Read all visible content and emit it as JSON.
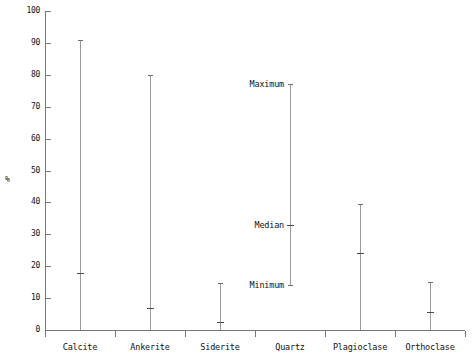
{
  "figure": {
    "width": 473,
    "height": 360,
    "background": "#ffffff"
  },
  "axes": {
    "y_title": "%",
    "y_ticks": [
      "0",
      "10",
      "20",
      "30",
      "40",
      "50",
      "60",
      "70",
      "80",
      "90",
      "100"
    ],
    "x_labels": [
      "Calcite",
      "Ankerite",
      "Siderite",
      "Quartz",
      "Plagioclase",
      "Orthoclase"
    ]
  },
  "annotations": [
    {
      "label": "Maximum",
      "value": 77
    },
    {
      "label": "Median",
      "value": 33
    },
    {
      "label": "Minimum",
      "value": 14
    }
  ],
  "colors": {
    "axis": "#777777",
    "range_line": "#9a9a9a",
    "cap": "#6f6f6f",
    "median": "#4a4a4a",
    "text": "#111111"
  },
  "chart_data": {
    "type": "bar",
    "title": "",
    "subtitle": "",
    "xlabel": "",
    "ylabel": "%",
    "ylim": [
      0,
      100
    ],
    "ytick_values": [
      0,
      10,
      20,
      30,
      40,
      50,
      60,
      70,
      80,
      90,
      100
    ],
    "grid": false,
    "legend": "none",
    "note": "Range (min-max) plot with median tick marks for mineral abundance in percent.",
    "categories": [
      "Calcite",
      "Ankerite",
      "Siderite",
      "Quartz",
      "Plagioclase",
      "Orthoclase"
    ],
    "series": [
      {
        "name": "Minimum",
        "values": [
          0,
          0,
          0,
          14,
          0,
          0
        ]
      },
      {
        "name": "Median",
        "values": [
          18,
          7,
          2.5,
          33,
          24,
          5.5
        ]
      },
      {
        "name": "Maximum",
        "values": [
          91,
          80,
          14.7,
          77,
          39.5,
          15
        ]
      }
    ]
  }
}
